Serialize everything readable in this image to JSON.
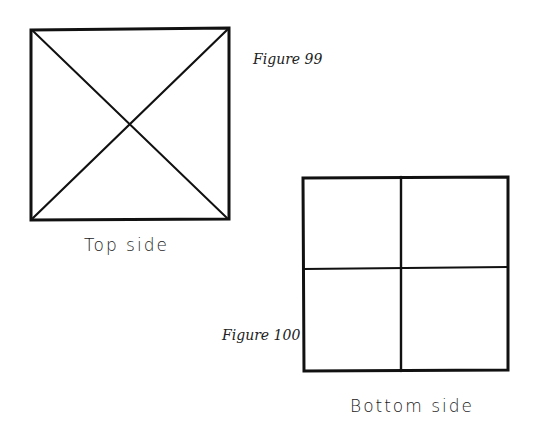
{
  "figures": [
    {
      "id": "figure-99",
      "caption": "Figure 99",
      "label": "Top side",
      "shape": "square-with-diagonals",
      "stroke_color": "#111111"
    },
    {
      "id": "figure-100",
      "caption": "Figure 100",
      "label": "Bottom side",
      "shape": "square-divided-into-quarters",
      "stroke_color": "#111111"
    }
  ]
}
